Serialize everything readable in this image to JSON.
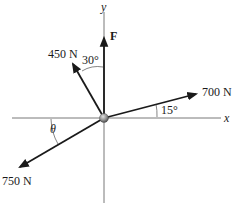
{
  "diagram": {
    "type": "force-vector-diagram",
    "axes": {
      "x_label": "x",
      "y_label": "y"
    },
    "forces": [
      {
        "name": "F",
        "label": "F",
        "direction": "along +y axis"
      },
      {
        "name": "450N",
        "label": "450 N",
        "angle_label": "30°",
        "angle_reference": "measured from +y axis toward -x"
      },
      {
        "name": "700N",
        "label": "700 N",
        "angle_label": "15°",
        "angle_reference": "measured from +x axis toward +y"
      },
      {
        "name": "750N",
        "label": "750 N",
        "angle_label": "θ",
        "angle_reference": "measured from -x axis toward -y"
      }
    ],
    "colors": {
      "line": "#1a1a1a",
      "axis": "#555555",
      "particle": "#8c8c8c"
    }
  }
}
